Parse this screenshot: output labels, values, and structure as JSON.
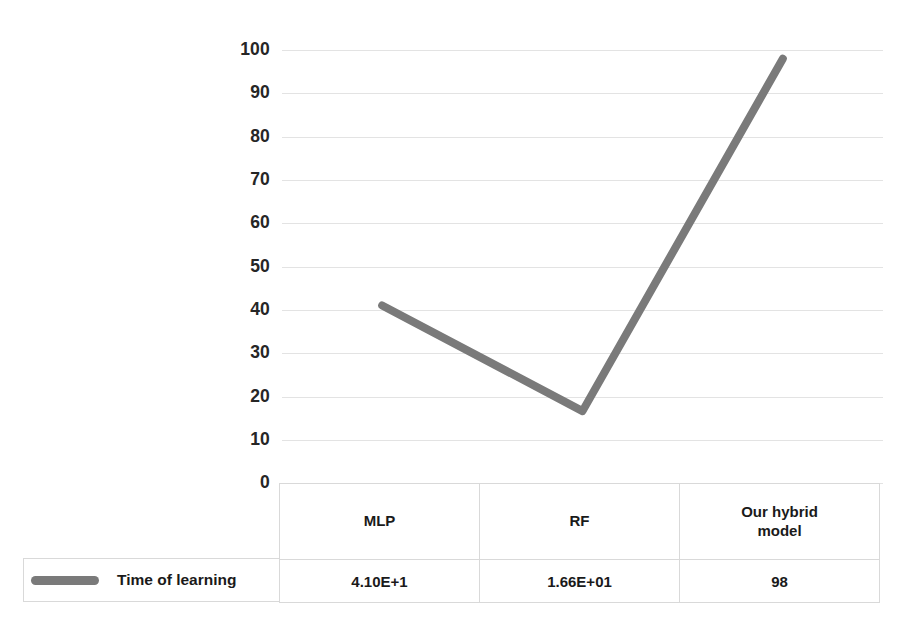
{
  "chart_data": {
    "type": "line",
    "title": "",
    "xlabel": "",
    "ylabel": "",
    "categories": [
      "MLP",
      "RF",
      "Our hybrid model"
    ],
    "series": [
      {
        "name": "Time of learning",
        "values": [
          41.0,
          16.6,
          98
        ],
        "display_values": [
          "4.10E+1",
          "1.66E+01",
          "98"
        ],
        "color": "#7a7a7a"
      }
    ],
    "ylim": [
      0,
      100
    ],
    "yticks": [
      100,
      90,
      80,
      70,
      60,
      50,
      40,
      30,
      20,
      10,
      0
    ],
    "ytick_labels": [
      "100",
      "90",
      "80",
      "70",
      "60",
      "50",
      "40",
      "30",
      "20",
      "10",
      "0"
    ],
    "grid": true,
    "grid_color": "#e3e3e3",
    "legend_position": "data-table-left",
    "has_data_table": true
  },
  "legend": {
    "series_label": "Time of learning",
    "swatch_icon": "line-swatch-icon",
    "swatch_color": "#7a7a7a"
  },
  "table": {
    "categories": [
      {
        "lines": [
          "MLP"
        ]
      },
      {
        "lines": [
          "RF"
        ]
      },
      {
        "lines": [
          "Our hybrid",
          "model"
        ]
      }
    ],
    "row_label": "Time of learning",
    "values": [
      "4.10E+1",
      "1.66E+01",
      "98"
    ]
  },
  "axis": {
    "y_ticks": [
      "100",
      "90",
      "80",
      "70",
      "60",
      "50",
      "40",
      "30",
      "20",
      "10",
      "0"
    ]
  }
}
